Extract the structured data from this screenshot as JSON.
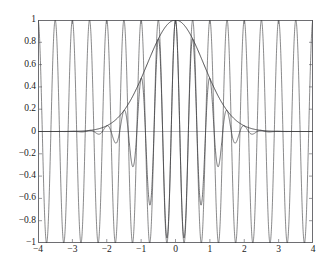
{
  "figure": {
    "top_caption": "",
    "background": "#ffffff",
    "frame_color": "#6e6e72",
    "line_color": "#3a3a3c"
  },
  "chart_data": {
    "type": "line",
    "title": "",
    "xlabel": "",
    "ylabel": "",
    "xlim": [
      -4,
      4
    ],
    "ylim": [
      -1,
      1
    ],
    "grid": false,
    "legend": "none",
    "xticks": [
      -4,
      -3,
      -2,
      -1,
      0,
      1,
      2,
      3,
      4
    ],
    "xticklabels": [
      "-4",
      "-3",
      "-2",
      "-1",
      "0",
      "1",
      "2",
      "3",
      "4"
    ],
    "yticks": [
      -1,
      -0.8,
      -0.6,
      -0.4,
      -0.2,
      0,
      0.2,
      0.4,
      0.6,
      0.8,
      1
    ],
    "yticklabels": [
      "-1",
      "-0.8",
      "-0.6",
      "-0.4",
      "-0.2",
      "0",
      "0.2",
      "0.4",
      "0.6",
      "0.8",
      "1"
    ],
    "series": [
      {
        "name": "carrier",
        "expr": "cos(2*pi*2*x)",
        "frequency_hz": 2,
        "amplitude": 1,
        "color": "#3a3a3c",
        "linewidth": 0.6
      },
      {
        "name": "gaussian-envelope",
        "expr": "exp(-pi*(x/1.45)^2)",
        "peak_x": 0,
        "peak_y": 1,
        "sigma": 0.82,
        "color": "#3a3a3c",
        "linewidth": 0.9
      },
      {
        "name": "gabor-modulated",
        "expr": "exp(-pi*(x/1.45)^2)*cos(2*pi*2*x)",
        "color": "#3a3a3c",
        "linewidth": 0.7
      }
    ]
  }
}
